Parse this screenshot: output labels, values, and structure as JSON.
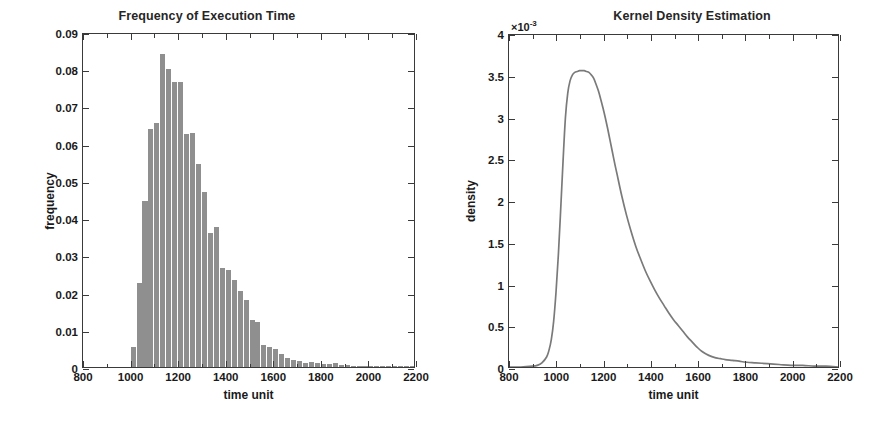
{
  "figure": {
    "background": "#ffffff",
    "bar_color": "#8f8f8f",
    "line_color": "#7a7a7a",
    "axis_color": "#3a3a3a"
  },
  "left": {
    "title": "Frequency of Execution Time",
    "xlabel": "time unit",
    "ylabel": "frequency",
    "xticklabels": [
      "800",
      "1000",
      "1200",
      "1400",
      "1600",
      "1800",
      "2000",
      "2200"
    ],
    "yticklabels": [
      "0",
      "0.01",
      "0.02",
      "0.03",
      "0.04",
      "0.05",
      "0.06",
      "0.07",
      "0.08",
      "0.09"
    ]
  },
  "right": {
    "title": "Kernel Density Estimation",
    "xlabel": "time unit",
    "ylabel": "density",
    "exponent_prefix": "×10",
    "exponent_power": "-3",
    "xticklabels": [
      "800",
      "1000",
      "1200",
      "1400",
      "1600",
      "1800",
      "2000",
      "2200"
    ],
    "yticklabels": [
      "0",
      "0.5",
      "1",
      "1.5",
      "2",
      "2.5",
      "3",
      "3.5",
      "4"
    ]
  },
  "chart_data": [
    {
      "type": "bar",
      "id": "frequency-histogram",
      "title": "Frequency of Execution Time",
      "xlabel": "time unit",
      "ylabel": "frequency",
      "xlim": [
        800,
        2200
      ],
      "ylim": [
        0,
        0.09
      ],
      "xticks": [
        800,
        1000,
        1200,
        1400,
        1600,
        1800,
        2000,
        2200
      ],
      "yticks": [
        0,
        0.01,
        0.02,
        0.03,
        0.04,
        0.05,
        0.06,
        0.07,
        0.08,
        0.09
      ],
      "grid": false,
      "legend": null,
      "bin_width": 25,
      "bin_left_edges": [
        1000,
        1025,
        1050,
        1075,
        1100,
        1125,
        1150,
        1175,
        1200,
        1225,
        1250,
        1275,
        1300,
        1325,
        1350,
        1375,
        1400,
        1425,
        1450,
        1475,
        1500,
        1525,
        1550,
        1575,
        1600,
        1625,
        1650,
        1675,
        1700,
        1725,
        1750,
        1775,
        1800,
        1825,
        1850,
        1875,
        1900,
        1925,
        1950,
        1975,
        2000,
        2025,
        2050,
        2075,
        2100,
        2125,
        2150,
        2175
      ],
      "values": [
        0.0055,
        0.0225,
        0.0445,
        0.064,
        0.0655,
        0.084,
        0.08,
        0.0765,
        0.0765,
        0.0625,
        0.063,
        0.0545,
        0.047,
        0.036,
        0.0375,
        0.0265,
        0.026,
        0.0235,
        0.0205,
        0.018,
        0.0125,
        0.012,
        0.006,
        0.0055,
        0.0048,
        0.0035,
        0.0025,
        0.0018,
        0.0015,
        0.0012,
        0.0014,
        0.001,
        0.0008,
        0.0007,
        0.001,
        0.0006,
        0.0005,
        0.0004,
        0.0004,
        0.0003,
        0.0003,
        0.0002,
        0.0002,
        0.0002,
        0.0001,
        0.0001,
        0.0001,
        0.0001
      ]
    },
    {
      "type": "line",
      "id": "kernel-density-estimation",
      "title": "Kernel Density Estimation",
      "xlabel": "time unit",
      "ylabel": "density",
      "y_multiplier": "×10⁻³",
      "xlim": [
        800,
        2200
      ],
      "ylim": [
        0,
        0.004
      ],
      "xticks": [
        800,
        1000,
        1200,
        1400,
        1600,
        1800,
        2000,
        2200
      ],
      "yticks": [
        0,
        0.0005,
        0.001,
        0.0015,
        0.002,
        0.0025,
        0.003,
        0.0035,
        0.004
      ],
      "grid": false,
      "legend": null,
      "x": [
        800,
        850,
        900,
        920,
        940,
        960,
        970,
        980,
        990,
        1000,
        1010,
        1020,
        1030,
        1040,
        1050,
        1060,
        1070,
        1080,
        1090,
        1100,
        1110,
        1120,
        1130,
        1140,
        1150,
        1160,
        1170,
        1180,
        1190,
        1200,
        1210,
        1220,
        1230,
        1240,
        1250,
        1260,
        1280,
        1300,
        1320,
        1340,
        1360,
        1380,
        1400,
        1420,
        1440,
        1460,
        1480,
        1500,
        1520,
        1540,
        1560,
        1580,
        1600,
        1620,
        1650,
        1680,
        1700,
        1720,
        1750,
        1780,
        1800,
        1850,
        1900,
        1950,
        2000,
        2050,
        2100,
        2150,
        2200
      ],
      "y": [
        0.0,
        0.0,
        1e-05,
        2e-05,
        5e-05,
        0.00012,
        0.0002,
        0.00033,
        0.00055,
        0.0009,
        0.00135,
        0.0019,
        0.00248,
        0.003,
        0.0033,
        0.00345,
        0.00352,
        0.00355,
        0.00356,
        0.00357,
        0.00357,
        0.00357,
        0.00356,
        0.00355,
        0.00352,
        0.00348,
        0.00341,
        0.00333,
        0.00323,
        0.00312,
        0.003,
        0.00287,
        0.00273,
        0.00259,
        0.00245,
        0.00232,
        0.00206,
        0.00183,
        0.00163,
        0.00145,
        0.0013,
        0.00116,
        0.00104,
        0.00093,
        0.00083,
        0.00074,
        0.00065,
        0.00057,
        0.0005,
        0.00043,
        0.00036,
        0.0003,
        0.00024,
        0.00019,
        0.00014,
        0.00011,
        0.0001,
        9e-05,
        8e-05,
        7e-05,
        6e-05,
        5e-05,
        4e-05,
        3e-05,
        2e-05,
        2e-05,
        1e-05,
        1e-05,
        0.0
      ]
    }
  ]
}
